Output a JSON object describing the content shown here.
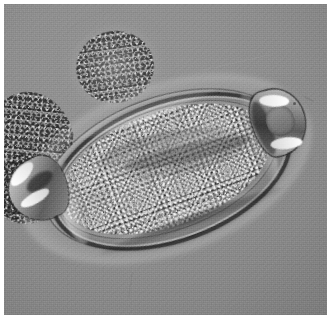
{
  "image": {
    "kind": "photomicrograph",
    "modality": "brightfield light microscopy",
    "color_mode": "grayscale",
    "width_px": 334,
    "height_px": 321,
    "border": {
      "style": "white photographic print margin",
      "color": "#ffffff",
      "width_px": 4
    },
    "background": {
      "description": "uniform mid-gray out-of-focus field",
      "color": "#8c8c8c",
      "vignette": true,
      "grain": "fine film grain with faint emulsion scratches"
    }
  },
  "subject": {
    "name": "helminth egg",
    "common_label": "parasite ovum",
    "shape": "barrel-shaped ellipsoid",
    "orientation_deg": -20,
    "position": {
      "x": 22,
      "y": 92,
      "width": 280,
      "height": 146
    },
    "features": [
      {
        "id": "shell-outer",
        "label": "outer shell layer",
        "tone": "#a6a6a6"
      },
      {
        "id": "shell-wall",
        "label": "thick dark shell wall",
        "tone": "#242424"
      },
      {
        "id": "shell-inner",
        "label": "inner vitelline membrane",
        "tone": "#3c3c3c"
      },
      {
        "id": "yolk",
        "label": "granular yolk mass",
        "tone": "#838383"
      },
      {
        "id": "embryo-fold",
        "label": "internal diagonal fold",
        "tone": "#3c3c3c"
      },
      {
        "id": "plug-left",
        "label": "left polar plug (operculum)",
        "tone": "#d8d8d8"
      },
      {
        "id": "plug-right",
        "label": "right polar plug (operculum)",
        "tone": "#c9c9c9"
      }
    ]
  },
  "debris": [
    {
      "id": "debris-top",
      "label": "granular debris clump above egg",
      "x": 72,
      "y": 27,
      "width": 78,
      "height": 72
    },
    {
      "id": "debris-left",
      "label": "granular debris field left of egg",
      "x": -26,
      "y": 88,
      "width": 96,
      "height": 128
    },
    {
      "id": "debris-leftlow",
      "label": "lower-left debris cluster",
      "x": -14,
      "y": 150,
      "width": 72,
      "height": 70
    }
  ],
  "annotations": {
    "scale_bar": null,
    "labels": [],
    "caption": null
  }
}
